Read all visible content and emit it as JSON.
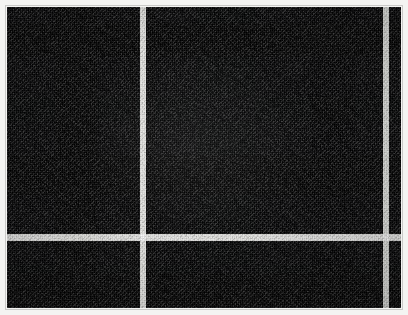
{
  "image": {
    "kind": "fabric-swatch-photo",
    "subject": "tartan plaid woven cloth",
    "width": 408,
    "height": 315,
    "alt_text": "Dark charcoal and black tartan plaid fabric swatch with thin white overcheck stripes"
  },
  "frame": {
    "mat_color": "#f4f4f2",
    "inner_line_color": "#c9c9c7",
    "mat_thickness_px": 7
  },
  "palette": {
    "ground_charcoal": "#34363a",
    "mid_gray": "#2c2e32",
    "dark_gray": "#232529",
    "near_black": "#121316",
    "black": "#0b0c0e",
    "overcheck_white": "#e8e8e6",
    "overcheck_white_soft": "#b9bab6"
  },
  "swatch": {
    "origin_x": 7,
    "origin_y": 7,
    "width": 394,
    "height": 301,
    "ground_color": "#34363a"
  },
  "pattern": {
    "sett_description": "asymmetric charcoal/black tartan with single white overcheck on each axis",
    "vertical_bands": [
      {
        "name": "band-charcoal-left",
        "x": 0,
        "w": 48,
        "color": "#35373b",
        "role": "ground"
      },
      {
        "name": "band-black-1",
        "x": 48,
        "w": 42,
        "color": "#0d0e11",
        "role": "black-block"
      },
      {
        "name": "band-charcoal-2",
        "x": 90,
        "w": 34,
        "color": "#33353a",
        "role": "ground"
      },
      {
        "name": "band-dark-narrow-1",
        "x": 124,
        "w": 5,
        "color": "#1b1d21",
        "role": "guard"
      },
      {
        "name": "band-charcoal-3",
        "x": 129,
        "w": 14,
        "color": "#34363b",
        "role": "ground"
      },
      {
        "name": "band-dark-narrow-2",
        "x": 143,
        "w": 5,
        "color": "#1b1d21",
        "role": "guard"
      },
      {
        "name": "band-charcoal-4",
        "x": 148,
        "w": 42,
        "color": "#33353a",
        "role": "ground"
      },
      {
        "name": "band-midgray-wide",
        "x": 190,
        "w": 58,
        "color": "#2b2d31",
        "role": "shadow-block"
      },
      {
        "name": "band-charcoal-5",
        "x": 248,
        "w": 56,
        "color": "#34363b",
        "role": "ground"
      },
      {
        "name": "band-black-2",
        "x": 304,
        "w": 44,
        "color": "#0e0f12",
        "role": "black-block"
      },
      {
        "name": "band-charcoal-6",
        "x": 348,
        "w": 26,
        "color": "#33353a",
        "role": "ground"
      },
      {
        "name": "band-dark-narrow-3",
        "x": 374,
        "w": 4,
        "color": "#1c1e22",
        "role": "guard"
      },
      {
        "name": "band-charcoal-7",
        "x": 382,
        "w": 12,
        "color": "#34363b",
        "role": "ground"
      }
    ],
    "vertical_overcheck_stripes": [
      {
        "name": "white-warp-stripe-main",
        "x": 133,
        "w": 6,
        "color": "#e6e6e3"
      },
      {
        "name": "white-warp-stripe-right",
        "x": 376,
        "w": 6,
        "color": "#dedfdb"
      }
    ],
    "horizontal_bands": [
      {
        "name": "row-charcoal-top",
        "y": 0,
        "h": 16,
        "color": "#34363a",
        "role": "ground"
      },
      {
        "name": "row-black-1",
        "y": 16,
        "h": 34,
        "color": "#0c0d10",
        "role": "black-block"
      },
      {
        "name": "row-charcoal-2",
        "y": 50,
        "h": 40,
        "color": "#34363b",
        "role": "ground"
      },
      {
        "name": "row-midgray-1",
        "y": 90,
        "h": 24,
        "color": "#2d2f33",
        "role": "shadow-block"
      },
      {
        "name": "row-charcoal-3",
        "y": 114,
        "h": 34,
        "color": "#34363b",
        "role": "ground"
      },
      {
        "name": "row-black-2",
        "y": 148,
        "h": 40,
        "color": "#0e0f12",
        "role": "black-block"
      },
      {
        "name": "row-charcoal-4",
        "y": 188,
        "h": 36,
        "color": "#33353a",
        "role": "ground"
      },
      {
        "name": "row-dark-guard-1",
        "y": 224,
        "h": 4,
        "color": "#1a1c20",
        "role": "guard"
      },
      {
        "name": "row-charcoal-5",
        "y": 234,
        "h": 24,
        "color": "#34363b",
        "role": "ground"
      },
      {
        "name": "row-midgray-2",
        "y": 258,
        "h": 8,
        "color": "#2b2d31",
        "role": "shadow-block"
      },
      {
        "name": "row-black-3",
        "y": 266,
        "h": 34,
        "color": "#0d0e11",
        "role": "black-block"
      }
    ],
    "horizontal_overcheck_stripes": [
      {
        "name": "white-weft-stripe-main",
        "y": 227,
        "h": 7,
        "color": "#e4e4e1"
      }
    ],
    "weave": {
      "warp_pitch_px": 2,
      "weft_pitch_px": 2,
      "twill_angle_deg": 45,
      "texture": "2x2 twill, visible thread grain"
    }
  }
}
